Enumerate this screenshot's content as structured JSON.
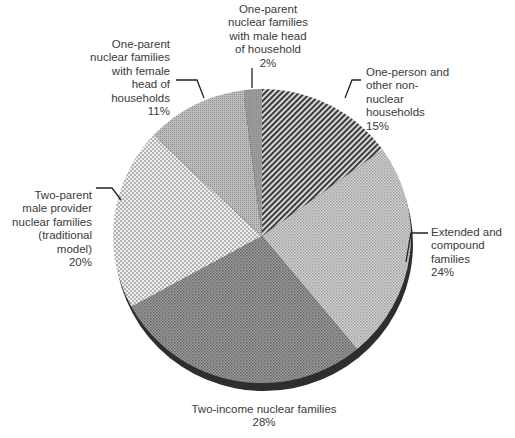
{
  "chart_data": {
    "type": "pie",
    "title": "",
    "start": "top",
    "direction": "clockwise",
    "slices": [
      {
        "label": "One-person and other non-nuclear households",
        "lines": [
          "One-person and",
          "other non-",
          "nuclear",
          "households"
        ],
        "value": 15,
        "value_label": "15%",
        "pattern": "diagonal-stripes",
        "color": "#555555"
      },
      {
        "label": "Extended and compound families",
        "lines": [
          "Extended and",
          "compound",
          "families"
        ],
        "value": 24,
        "value_label": "24%",
        "pattern": "fine-crosshatch-light",
        "color": "#b4b4b4"
      },
      {
        "label": "Two-income nuclear families",
        "lines": [
          "Two-income nuclear families"
        ],
        "value": 28,
        "value_label": "28%",
        "pattern": "crosshatch-dark",
        "color": "#8a8a8a"
      },
      {
        "label": "Two-parent male provider nuclear families (traditional model)",
        "lines": [
          "Two-parent",
          "male provider",
          "nuclear families",
          "(traditional",
          "model)"
        ],
        "value": 20,
        "value_label": "20%",
        "pattern": "checker-light",
        "color": "#c8c8c8"
      },
      {
        "label": "One-parent nuclear families with female head of households",
        "lines": [
          "One-parent",
          "nuclear families",
          "with female",
          "head of",
          "households"
        ],
        "value": 11,
        "value_label": "11%",
        "pattern": "fine-dots-medium",
        "color": "#a6a6a6"
      },
      {
        "label": "One-parent nuclear families with male head of household",
        "lines": [
          "One-parent",
          "nuclear families",
          "with male head",
          "of household"
        ],
        "value": 2,
        "value_label": "2%",
        "pattern": "solid-medium",
        "color": "#9a9a9a"
      }
    ],
    "legend": "none",
    "labels": "outside-with-leader-lines"
  }
}
